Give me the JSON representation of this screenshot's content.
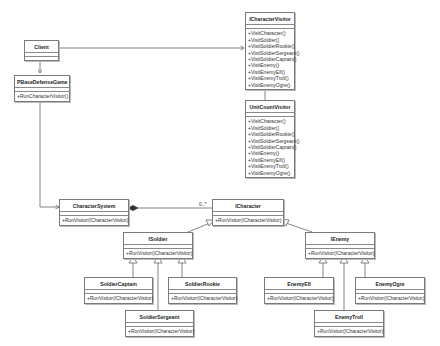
{
  "diagram": {
    "type": "UML class diagram",
    "classes": {
      "client": {
        "name": "Client",
        "operations": []
      },
      "pbase": {
        "name": "PBaseDefenseGame",
        "operations": [
          "+RunCharacterVisitor()"
        ]
      },
      "icv": {
        "name": "ICharacterVisitor",
        "operations": [
          "+VisitCharacter()",
          "+VisitSoldier()",
          "+VisitSoldierRookie()",
          "+VisitSoldierSergeant()",
          "+VisitSoldierCaptain()",
          "+VisitEnemy()",
          "+VisitEnemyElf()",
          "+VisitEnemyTroll()",
          "+VisitEnemyOgre()"
        ]
      },
      "ucv": {
        "name": "UnitCountVisitor",
        "operations": [
          "+VisitCharacter()",
          "+VisitSoldier()",
          "+VisitSoldierRookie()",
          "+VisitSoldierSergeant()",
          "+VisitSoldierCaptain()",
          "+VisitEnemy()",
          "+VisitEnemyElf()",
          "+VisitEnemyTroll()",
          "+VisitEnemyOgre()"
        ]
      },
      "charsys": {
        "name": "CharacterSystem",
        "operations": [
          "+RunVisitor(ICharacterVisitor)"
        ]
      },
      "ichar": {
        "name": "ICharacter",
        "operations": [
          "+RunVisitor(ICharacterVisitor)"
        ]
      },
      "isoldier": {
        "name": "ISoldier",
        "operations": [
          "+RunVisitor(ICharacterVisitor)"
        ]
      },
      "ienemy": {
        "name": "IEnemy",
        "operations": [
          "+RunVisitor(ICharacterVisitor)"
        ]
      },
      "scaptain": {
        "name": "SoldierCaptain",
        "operations": [
          "+RunVisitor(ICharacterVisitor)"
        ]
      },
      "srookie": {
        "name": "SoldierRookie",
        "operations": [
          "+RunVisitor(ICharacterVisitor)"
        ]
      },
      "ssergeant": {
        "name": "SoldierSergeant",
        "operations": [
          "+RunVisitor(ICharacterVisitor)"
        ]
      },
      "eelf": {
        "name": "EnemyElf",
        "operations": [
          "+RunVisitor(ICharacterVisitor)"
        ]
      },
      "eogre": {
        "name": "EnemyOgre",
        "operations": [
          "+RunVisitor(ICharacterVisitor)"
        ]
      },
      "etroll": {
        "name": "EnemyTroll",
        "operations": [
          "+RunVisitor(ICharacterVisitor)"
        ]
      }
    },
    "multiplicity": {
      "composition_end": "0..*"
    },
    "relationships": [
      {
        "from": "Client",
        "to": "ICharacterVisitor",
        "type": "association"
      },
      {
        "from": "Client",
        "to": "PBaseDefenseGame",
        "type": "association"
      },
      {
        "from": "PBaseDefenseGame",
        "to": "CharacterSystem",
        "type": "association"
      },
      {
        "from": "UnitCountVisitor",
        "to": "ICharacterVisitor",
        "type": "generalization"
      },
      {
        "from": "CharacterSystem",
        "to": "ICharacter",
        "type": "composition",
        "multiplicity": "0..*"
      },
      {
        "from": "ISoldier",
        "to": "ICharacter",
        "type": "generalization"
      },
      {
        "from": "IEnemy",
        "to": "ICharacter",
        "type": "generalization"
      },
      {
        "from": "SoldierCaptain",
        "to": "ISoldier",
        "type": "generalization"
      },
      {
        "from": "SoldierSergeant",
        "to": "ISoldier",
        "type": "generalization"
      },
      {
        "from": "SoldierRookie",
        "to": "ISoldier",
        "type": "generalization"
      },
      {
        "from": "EnemyElf",
        "to": "IEnemy",
        "type": "generalization"
      },
      {
        "from": "EnemyTroll",
        "to": "IEnemy",
        "type": "generalization"
      },
      {
        "from": "EnemyOgre",
        "to": "IEnemy",
        "type": "generalization"
      }
    ]
  }
}
